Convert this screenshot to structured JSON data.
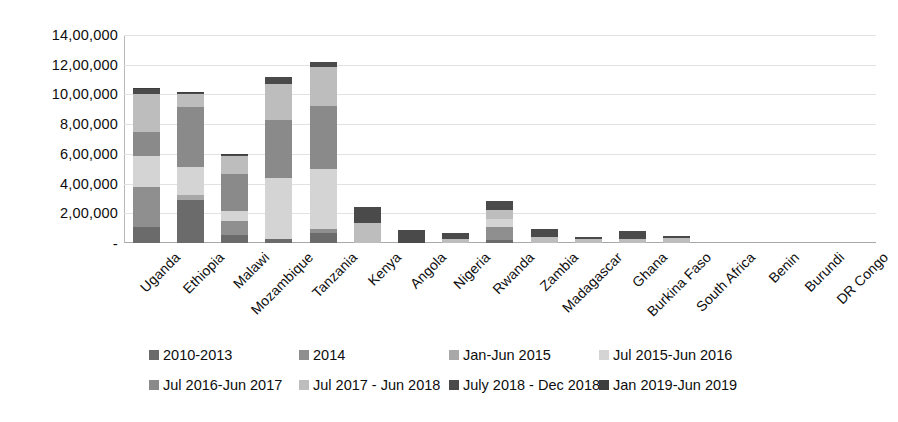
{
  "chart_data": {
    "type": "bar",
    "subtype": "stacked-vertical",
    "title": "",
    "xlabel": "",
    "ylabel": "",
    "ylim": [
      0,
      1400000
    ],
    "ytick_values": [
      0,
      200000,
      400000,
      600000,
      800000,
      1000000,
      1200000,
      1400000
    ],
    "ytick_labels": [
      "-",
      "2,00,000",
      "4,00,000",
      "6,00,000",
      "8,00,000",
      "10,00,000",
      "12,00,000",
      "14,00,000"
    ],
    "grid": true,
    "grid_axis": "y",
    "legend_position": "bottom",
    "legend_columns": 4,
    "number_format": "indian-lakh",
    "categories": [
      "Uganda",
      "Ethiopia",
      "Malawi",
      "Mozambique",
      "Tanzania",
      "Kenya",
      "Angola",
      "Nigeria",
      "Rwanda",
      "Zambia",
      "Madagascar",
      "Ghana",
      "Burkina Faso",
      "South Africa",
      "Benin",
      "Burundi",
      "DR Congo"
    ],
    "series": [
      {
        "name": "2010-2013",
        "color": "#6b6b6b",
        "values": [
          105000,
          290000,
          55000,
          30000,
          65000,
          0,
          0,
          0,
          20000,
          0,
          0,
          0,
          0,
          0,
          0,
          0,
          0
        ]
      },
      {
        "name": "2014",
        "color": "#8f8f8f",
        "values": [
          270000,
          0,
          90000,
          0,
          30000,
          0,
          0,
          0,
          90000,
          0,
          0,
          0,
          0,
          0,
          0,
          0,
          0
        ]
      },
      {
        "name": "Jan-Jun 2015",
        "color": "#a8a8a8",
        "values": [
          0,
          35000,
          0,
          0,
          0,
          0,
          0,
          0,
          0,
          0,
          0,
          0,
          0,
          0,
          0,
          0,
          0
        ]
      },
      {
        "name": "Jul 2015-Jun 2016",
        "color": "#d4d4d4",
        "values": [
          210000,
          190000,
          70000,
          410000,
          400000,
          0,
          0,
          0,
          55000,
          0,
          0,
          0,
          0,
          0,
          0,
          0,
          0
        ]
      },
      {
        "name": "Jul 2016-Jun 2017",
        "color": "#8a8a8a",
        "values": [
          165000,
          400000,
          250000,
          390000,
          430000,
          0,
          0,
          0,
          0,
          0,
          0,
          0,
          0,
          0,
          0,
          0,
          0
        ]
      },
      {
        "name": "Jul 2017 - Jun 2018",
        "color": "#bdbdbd",
        "values": [
          250000,
          90000,
          120000,
          240000,
          260000,
          135000,
          0,
          30000,
          60000,
          40000,
          30000,
          30000,
          35000,
          0,
          0,
          0,
          0
        ]
      },
      {
        "name": "July 2018 - Dec 2018",
        "color": "#4a4a4a",
        "values": [
          35000,
          5000,
          10000,
          50000,
          35000,
          110000,
          90000,
          40000,
          55000,
          55000,
          10000,
          50000,
          15000,
          0,
          0,
          0,
          0
        ]
      },
      {
        "name": "Jan 2019-Jun 2019",
        "color": "#3d3d3d",
        "values": [
          10000,
          5000,
          5000,
          0,
          0,
          0,
          0,
          0,
          0,
          0,
          0,
          0,
          0,
          0,
          0,
          0,
          0
        ]
      }
    ],
    "category_totals": [
      1045000,
      1015000,
      600000,
      1120000,
      1220000,
      245000,
      90000,
      70000,
      280000,
      95000,
      40000,
      80000,
      50000,
      0,
      0,
      0,
      0
    ]
  },
  "legend": {
    "items": [
      {
        "label": "2010-2013",
        "color": "#6b6b6b"
      },
      {
        "label": "2014",
        "color": "#8f8f8f"
      },
      {
        "label": "Jan-Jun 2015",
        "color": "#a8a8a8"
      },
      {
        "label": "Jul 2015-Jun 2016",
        "color": "#d4d4d4"
      },
      {
        "label": "Jul 2016-Jun 2017",
        "color": "#8a8a8a"
      },
      {
        "label": "Jul 2017 - Jun 2018",
        "color": "#bdbdbd"
      },
      {
        "label": "July 2018 - Dec 2018",
        "color": "#4a4a4a"
      },
      {
        "label": "Jan 2019-Jun 2019",
        "color": "#3d3d3d"
      }
    ]
  }
}
